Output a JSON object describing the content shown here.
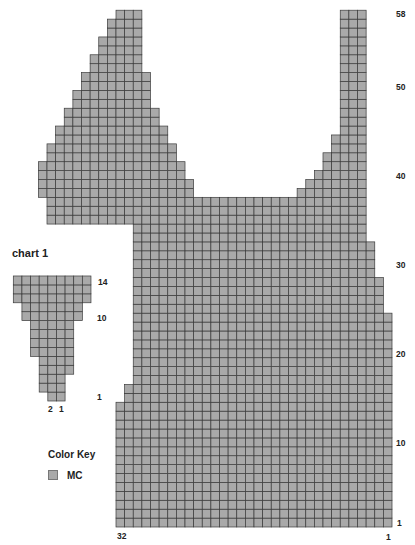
{
  "main_chart": {
    "origin_x": 116,
    "bottom_y": 527,
    "cell_w": 8.625,
    "cell_h": 8.91,
    "columns": 32,
    "rows": 58,
    "fill": "#a9a9a9",
    "line": "#3a3a3a",
    "row_segments": {
      "58": [
        [
          0,
          3
        ],
        [
          26,
          29
        ]
      ],
      "57": [
        [
          -1,
          3
        ],
        [
          26,
          29
        ]
      ],
      "56": [
        [
          -1,
          3
        ],
        [
          26,
          29
        ]
      ],
      "55": [
        [
          -2,
          3
        ],
        [
          26,
          29
        ]
      ],
      "54": [
        [
          -2,
          3
        ],
        [
          26,
          29
        ]
      ],
      "53": [
        [
          -3,
          3
        ],
        [
          26,
          29
        ]
      ],
      "52": [
        [
          -3,
          3
        ],
        [
          26,
          29
        ]
      ],
      "51": [
        [
          -4,
          4
        ],
        [
          26,
          29
        ]
      ],
      "50": [
        [
          -4,
          4
        ],
        [
          26,
          29
        ]
      ],
      "49": [
        [
          -5,
          4
        ],
        [
          26,
          29
        ]
      ],
      "48": [
        [
          -5,
          4
        ],
        [
          26,
          29
        ]
      ],
      "47": [
        [
          -6,
          5
        ],
        [
          26,
          29
        ]
      ],
      "46": [
        [
          -6,
          5
        ],
        [
          26,
          29
        ]
      ],
      "45": [
        [
          -7,
          6
        ],
        [
          26,
          29
        ]
      ],
      "44": [
        [
          -7,
          6
        ],
        [
          25,
          29
        ]
      ],
      "43": [
        [
          -8,
          7
        ],
        [
          25,
          29
        ]
      ],
      "42": [
        [
          -8,
          7
        ],
        [
          24,
          29
        ]
      ],
      "41": [
        [
          -9,
          8
        ],
        [
          24,
          29
        ]
      ],
      "40": [
        [
          -9,
          8
        ],
        [
          23,
          29
        ]
      ],
      "39": [
        [
          -9,
          9
        ],
        [
          22,
          29
        ]
      ],
      "38": [
        [
          -9,
          9
        ],
        [
          21,
          29
        ]
      ],
      "37": [
        [
          -8,
          29
        ]
      ],
      "36": [
        [
          -8,
          29
        ]
      ],
      "35": [
        [
          -8,
          29
        ]
      ],
      "34": [
        [
          2,
          29
        ]
      ],
      "33": [
        [
          2,
          29
        ]
      ],
      "32": [
        [
          2,
          30
        ]
      ],
      "31": [
        [
          2,
          30
        ]
      ],
      "30": [
        [
          2,
          30
        ]
      ],
      "29": [
        [
          2,
          30
        ]
      ],
      "28": [
        [
          2,
          31
        ]
      ],
      "27": [
        [
          2,
          31
        ]
      ],
      "26": [
        [
          2,
          31
        ]
      ],
      "25": [
        [
          2,
          31
        ]
      ],
      "24": [
        [
          2,
          32
        ]
      ],
      "23": [
        [
          2,
          32
        ]
      ],
      "22": [
        [
          2,
          32
        ]
      ],
      "21": [
        [
          2,
          32
        ]
      ],
      "20": [
        [
          2,
          32
        ]
      ],
      "19": [
        [
          2,
          32
        ]
      ],
      "18": [
        [
          2,
          32
        ]
      ],
      "17": [
        [
          2,
          32
        ]
      ],
      "16": [
        [
          1,
          32
        ]
      ],
      "15": [
        [
          1,
          32
        ]
      ],
      "14": [
        [
          0,
          32
        ]
      ],
      "13": [
        [
          0,
          32
        ]
      ],
      "12": [
        [
          0,
          32
        ]
      ],
      "11": [
        [
          0,
          32
        ]
      ],
      "10": [
        [
          0,
          32
        ]
      ],
      "9": [
        [
          0,
          32
        ]
      ],
      "8": [
        [
          0,
          32
        ]
      ],
      "7": [
        [
          0,
          32
        ]
      ],
      "6": [
        [
          0,
          32
        ]
      ],
      "5": [
        [
          0,
          32
        ]
      ],
      "4": [
        [
          0,
          32
        ]
      ],
      "3": [
        [
          0,
          32
        ]
      ],
      "2": [
        [
          0,
          32
        ]
      ],
      "1": [
        [
          0,
          32
        ]
      ]
    },
    "row_labels": [
      "58",
      "50",
      "40",
      "30",
      "20",
      "10",
      "1"
    ],
    "col_label_left": "32",
    "col_label_right": "1"
  },
  "chart1": {
    "title": "chart 1",
    "origin_x": 13.3,
    "bottom_y": 401,
    "cell_w": 8.63,
    "cell_h": 8.93,
    "rows": 14,
    "columns": 9,
    "row_segments": {
      "14": [
        [
          0,
          9
        ]
      ],
      "13": [
        [
          0,
          9
        ]
      ],
      "12": [
        [
          0,
          9
        ]
      ],
      "11": [
        [
          1,
          8
        ]
      ],
      "10": [
        [
          1,
          8
        ]
      ],
      "9": [
        [
          2,
          7
        ]
      ],
      "8": [
        [
          2,
          7
        ]
      ],
      "7": [
        [
          2,
          7
        ]
      ],
      "6": [
        [
          2,
          7
        ]
      ],
      "5": [
        [
          3,
          7
        ]
      ],
      "4": [
        [
          3,
          7
        ]
      ],
      "3": [
        [
          3,
          6
        ]
      ],
      "2": [
        [
          3,
          6
        ]
      ],
      "1": [
        [
          4,
          6
        ]
      ]
    },
    "row_labels": [
      "14",
      "10",
      "1"
    ],
    "col_labels": [
      "2",
      "1"
    ]
  },
  "color_key": {
    "title": "Color Key",
    "items": [
      {
        "label": "MC",
        "color": "#a9a9a9"
      }
    ]
  },
  "chart_data": [
    {
      "type": "heatmap",
      "title": "",
      "description": "Knitting chart: 32 stitches x 58 rows, shaped body with neckline and two straps",
      "xlabel": "stitches",
      "ylabel": "rows",
      "x_ticks": [
        "32",
        "1"
      ],
      "y_ticks": [
        "1",
        "10",
        "20",
        "30",
        "40",
        "50",
        "58"
      ],
      "grid": true,
      "legend": [
        "MC"
      ]
    },
    {
      "type": "heatmap",
      "title": "chart 1",
      "description": "Small inverted-triangle chart, 9 stitches x 14 rows",
      "x_ticks": [
        "2",
        "1"
      ],
      "y_ticks": [
        "1",
        "10",
        "14"
      ],
      "grid": true,
      "legend": [
        "MC"
      ]
    }
  ]
}
